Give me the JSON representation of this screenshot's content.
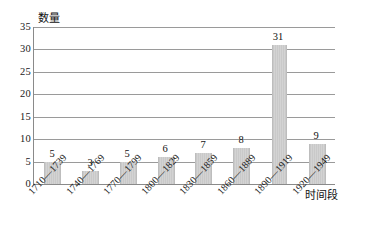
{
  "chart_data": {
    "type": "bar",
    "title": "",
    "xlabel": "时间段",
    "ylabel": "数量",
    "ylim": [
      0,
      35
    ],
    "grid": true,
    "legend": "none",
    "y_ticks": [
      35,
      30,
      25,
      20,
      15,
      10,
      5,
      0
    ],
    "categories": [
      "1710—1739",
      "1740—1769",
      "1770—1799",
      "1800—1829",
      "1830—1859",
      "1860—1889",
      "1890—1919",
      "1920—1949"
    ],
    "values": [
      5,
      3,
      5,
      6,
      7,
      8,
      31,
      9
    ],
    "bar_color": "#cccccc",
    "gridline_color": "#9a9a9a",
    "axis_color": "#8a8a8a",
    "text_color": "#1a1a1a"
  }
}
